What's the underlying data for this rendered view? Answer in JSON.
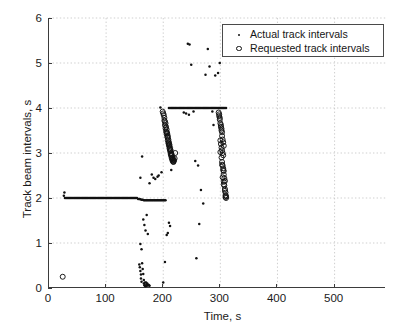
{
  "chart_data": {
    "type": "scatter",
    "title": "",
    "xlabel": "Time, s",
    "ylabel": "Track beam intervals, s",
    "xlim": [
      0,
      590
    ],
    "ylim": [
      0,
      6
    ],
    "xticks": [
      0,
      100,
      200,
      300,
      400,
      500
    ],
    "yticks": [
      0,
      1,
      2,
      3,
      4,
      5,
      6
    ],
    "grid": true,
    "legend_position": "top-right",
    "series": [
      {
        "name": "Actual track intervals",
        "marker": "dot",
        "color": "#111111",
        "points": [
          [
            26,
            2.05
          ],
          [
            27,
            2.12
          ],
          [
            28,
            2.0
          ],
          [
            30,
            2.0
          ],
          [
            32,
            2.0
          ],
          [
            34,
            2.0
          ],
          [
            36,
            2.0
          ],
          [
            38,
            2.0
          ],
          [
            40,
            2.0
          ],
          [
            42,
            2.0
          ],
          [
            44,
            2.0
          ],
          [
            46,
            2.0
          ],
          [
            48,
            2.0
          ],
          [
            50,
            2.0
          ],
          [
            52,
            2.0
          ],
          [
            54,
            2.0
          ],
          [
            56,
            2.0
          ],
          [
            58,
            2.0
          ],
          [
            60,
            2.0
          ],
          [
            62,
            2.0
          ],
          [
            64,
            2.0
          ],
          [
            66,
            2.0
          ],
          [
            68,
            2.0
          ],
          [
            70,
            2.0
          ],
          [
            72,
            2.0
          ],
          [
            74,
            2.0
          ],
          [
            76,
            2.0
          ],
          [
            78,
            2.0
          ],
          [
            80,
            2.0
          ],
          [
            82,
            2.0
          ],
          [
            84,
            2.0
          ],
          [
            86,
            2.0
          ],
          [
            88,
            2.0
          ],
          [
            90,
            2.0
          ],
          [
            92,
            2.0
          ],
          [
            94,
            2.0
          ],
          [
            96,
            2.0
          ],
          [
            98,
            2.0
          ],
          [
            100,
            2.0
          ],
          [
            102,
            2.0
          ],
          [
            104,
            2.0
          ],
          [
            106,
            2.0
          ],
          [
            108,
            2.0
          ],
          [
            110,
            2.0
          ],
          [
            112,
            2.0
          ],
          [
            114,
            2.0
          ],
          [
            116,
            2.0
          ],
          [
            118,
            2.0
          ],
          [
            120,
            2.0
          ],
          [
            122,
            2.0
          ],
          [
            124,
            2.0
          ],
          [
            126,
            2.0
          ],
          [
            128,
            2.0
          ],
          [
            130,
            2.0
          ],
          [
            132,
            2.0
          ],
          [
            134,
            2.0
          ],
          [
            136,
            2.0
          ],
          [
            138,
            2.0
          ],
          [
            140,
            2.0
          ],
          [
            142,
            2.0
          ],
          [
            144,
            2.0
          ],
          [
            146,
            2.0
          ],
          [
            148,
            2.0
          ],
          [
            150,
            2.0
          ],
          [
            152,
            2.0
          ],
          [
            154,
            2.0
          ],
          [
            156,
            1.98
          ],
          [
            158,
            1.98
          ],
          [
            160,
            1.97
          ],
          [
            162,
            1.96
          ],
          [
            164,
            1.96
          ],
          [
            166,
            1.95
          ],
          [
            168,
            1.95
          ],
          [
            170,
            1.95
          ],
          [
            172,
            1.95
          ],
          [
            174,
            1.95
          ],
          [
            176,
            1.95
          ],
          [
            178,
            1.95
          ],
          [
            180,
            1.95
          ],
          [
            182,
            1.95
          ],
          [
            184,
            1.95
          ],
          [
            186,
            1.95
          ],
          [
            188,
            1.95
          ],
          [
            190,
            1.95
          ],
          [
            192,
            1.95
          ],
          [
            194,
            1.95
          ],
          [
            196,
            1.95
          ],
          [
            198,
            1.95
          ],
          [
            200,
            1.95
          ],
          [
            202,
            1.95
          ],
          [
            204,
            1.95
          ],
          [
            158,
            0.52
          ],
          [
            159,
            0.46
          ],
          [
            160,
            0.38
          ],
          [
            161,
            0.3
          ],
          [
            161,
            0.21
          ],
          [
            162,
            0.14
          ],
          [
            163,
            0.55
          ],
          [
            164,
            0.42
          ],
          [
            165,
            0.31
          ],
          [
            166,
            0.18
          ],
          [
            166,
            0.1
          ],
          [
            167,
            0.06
          ],
          [
            168,
            0.05
          ],
          [
            169,
            0.04
          ],
          [
            170,
            0.06
          ],
          [
            171,
            0.05
          ],
          [
            172,
            0.06
          ],
          [
            173,
            0.06
          ],
          [
            174,
            0.07
          ],
          [
            175,
            0.06
          ],
          [
            176,
            0.05
          ],
          [
            168,
            0.12
          ],
          [
            170,
            0.12
          ],
          [
            172,
            0.1
          ],
          [
            160,
            0.98
          ],
          [
            162,
            0.86
          ],
          [
            165,
            1.52
          ],
          [
            167,
            1.4
          ],
          [
            169,
            1.28
          ],
          [
            171,
            1.62
          ],
          [
            173,
            1.2
          ],
          [
            160,
            2.45
          ],
          [
            163,
            2.92
          ],
          [
            176,
            2.33
          ],
          [
            180,
            2.52
          ],
          [
            183,
            2.45
          ],
          [
            186,
            2.42
          ],
          [
            190,
            2.47
          ],
          [
            192,
            2.5
          ],
          [
            195,
            4.01
          ],
          [
            197,
            2.57
          ],
          [
            200,
            0.12
          ],
          [
            203,
            0.58
          ],
          [
            206,
            1.18
          ],
          [
            208,
            1.22
          ],
          [
            210,
            1.45
          ],
          [
            212,
            1.38
          ],
          [
            214,
            2.62
          ],
          [
            216,
            2.82
          ],
          [
            218,
            2.9
          ],
          [
            210,
            4.0
          ],
          [
            212,
            4.0
          ],
          [
            214,
            4.0
          ],
          [
            216,
            4.0
          ],
          [
            218,
            4.0
          ],
          [
            220,
            4.0
          ],
          [
            222,
            4.0
          ],
          [
            224,
            4.0
          ],
          [
            226,
            4.0
          ],
          [
            228,
            4.0
          ],
          [
            230,
            4.0
          ],
          [
            232,
            4.0
          ],
          [
            234,
            4.0
          ],
          [
            236,
            4.0
          ],
          [
            238,
            4.0
          ],
          [
            240,
            4.0
          ],
          [
            242,
            4.0
          ],
          [
            244,
            4.0
          ],
          [
            246,
            4.0
          ],
          [
            248,
            4.0
          ],
          [
            250,
            4.0
          ],
          [
            252,
            4.0
          ],
          [
            254,
            4.0
          ],
          [
            256,
            4.0
          ],
          [
            258,
            4.0
          ],
          [
            260,
            4.0
          ],
          [
            262,
            4.0
          ],
          [
            264,
            4.0
          ],
          [
            266,
            4.0
          ],
          [
            268,
            4.0
          ],
          [
            270,
            4.0
          ],
          [
            272,
            4.0
          ],
          [
            274,
            4.0
          ],
          [
            276,
            4.0
          ],
          [
            278,
            4.0
          ],
          [
            280,
            4.0
          ],
          [
            282,
            4.0
          ],
          [
            284,
            4.0
          ],
          [
            286,
            4.0
          ],
          [
            288,
            4.0
          ],
          [
            290,
            4.0
          ],
          [
            292,
            4.0
          ],
          [
            294,
            4.0
          ],
          [
            296,
            4.0
          ],
          [
            298,
            4.0
          ],
          [
            300,
            4.0
          ],
          [
            302,
            4.0
          ],
          [
            304,
            4.0
          ],
          [
            306,
            4.0
          ],
          [
            308,
            4.0
          ],
          [
            310,
            4.0
          ],
          [
            243,
            5.43
          ],
          [
            246,
            5.41
          ],
          [
            249,
            4.96
          ],
          [
            253,
            3.92
          ],
          [
            256,
            2.82
          ],
          [
            258,
            0.66
          ],
          [
            261,
            2.72
          ],
          [
            263,
            1.42
          ],
          [
            266,
            2.18
          ],
          [
            270,
            1.88
          ],
          [
            274,
            4.74
          ],
          [
            278,
            5.31
          ],
          [
            281,
            4.92
          ],
          [
            286,
            3.92
          ],
          [
            291,
            4.72
          ],
          [
            296,
            4.78
          ],
          [
            299,
            5.0
          ],
          [
            288,
            3.62
          ],
          [
            245,
            3.85
          ],
          [
            240,
            3.88
          ],
          [
            236,
            3.9
          ]
        ]
      },
      {
        "name": "Requested track intervals",
        "marker": "circle",
        "color": "#111111",
        "points": [
          [
            24,
            0.25
          ],
          [
            199,
            3.92
          ],
          [
            201,
            3.84
          ],
          [
            202,
            3.72
          ],
          [
            203,
            3.62
          ],
          [
            204,
            3.55
          ],
          [
            205,
            3.48
          ],
          [
            206,
            3.42
          ],
          [
            207,
            3.36
          ],
          [
            208,
            3.28
          ],
          [
            209,
            3.22
          ],
          [
            210,
            3.16
          ],
          [
            211,
            3.1
          ],
          [
            212,
            3.04
          ],
          [
            213,
            2.98
          ],
          [
            214,
            2.93
          ],
          [
            215,
            2.88
          ],
          [
            216,
            2.84
          ],
          [
            217,
            2.81
          ],
          [
            218,
            2.8
          ],
          [
            203,
            3.7
          ],
          [
            205,
            3.58
          ],
          [
            207,
            3.44
          ],
          [
            209,
            3.3
          ],
          [
            211,
            3.18
          ],
          [
            213,
            3.06
          ],
          [
            215,
            2.96
          ],
          [
            217,
            2.86
          ],
          [
            200,
            3.88
          ],
          [
            202,
            3.78
          ],
          [
            204,
            3.66
          ],
          [
            206,
            3.52
          ],
          [
            208,
            3.38
          ],
          [
            210,
            3.24
          ],
          [
            212,
            3.12
          ],
          [
            214,
            3.0
          ],
          [
            216,
            2.9
          ],
          [
            218,
            2.82
          ],
          [
            206,
            3.46
          ],
          [
            210,
            3.2
          ],
          [
            214,
            2.96
          ],
          [
            208,
            3.34
          ],
          [
            212,
            3.08
          ],
          [
            216,
            2.88
          ],
          [
            219,
            2.84
          ],
          [
            220,
            2.88
          ],
          [
            221,
            3.0
          ],
          [
            297,
            3.9
          ],
          [
            298,
            3.82
          ],
          [
            299,
            3.74
          ],
          [
            300,
            3.66
          ],
          [
            301,
            3.58
          ],
          [
            302,
            3.5
          ],
          [
            300,
            3.28
          ],
          [
            301,
            3.2
          ],
          [
            302,
            3.12
          ],
          [
            303,
            3.06
          ],
          [
            304,
            3.0
          ],
          [
            305,
            2.95
          ],
          [
            300,
            3.02
          ],
          [
            302,
            2.9
          ],
          [
            303,
            2.8
          ],
          [
            304,
            2.72
          ],
          [
            305,
            2.66
          ],
          [
            306,
            2.6
          ],
          [
            303,
            2.74
          ],
          [
            305,
            2.62
          ],
          [
            306,
            2.52
          ],
          [
            307,
            2.44
          ],
          [
            308,
            2.38
          ],
          [
            304,
            2.46
          ],
          [
            306,
            2.36
          ],
          [
            307,
            2.28
          ],
          [
            308,
            2.2
          ],
          [
            309,
            2.12
          ],
          [
            306,
            2.3
          ],
          [
            308,
            2.16
          ],
          [
            309,
            2.06
          ],
          [
            310,
            2.0
          ],
          [
            309,
            2.02
          ],
          [
            310,
            2.04
          ],
          [
            298,
            3.86
          ],
          [
            299,
            3.78
          ],
          [
            301,
            3.62
          ],
          [
            302,
            3.54
          ],
          [
            303,
            3.46
          ],
          [
            303,
            3.38
          ],
          [
            304,
            3.3
          ],
          [
            305,
            3.24
          ],
          [
            306,
            3.16
          ]
        ]
      }
    ]
  },
  "legend": {
    "items": [
      {
        "symbol": "dot",
        "label": "Actual track intervals"
      },
      {
        "symbol": "circle",
        "label": "Requested track intervals"
      }
    ]
  },
  "axes": {
    "x_title": "Time, s",
    "y_title": "Track beam intervals, s",
    "x_tick_labels": [
      "0",
      "100",
      "200",
      "300",
      "400",
      "500"
    ],
    "y_tick_labels": [
      "0",
      "1",
      "2",
      "3",
      "4",
      "5",
      "6"
    ]
  },
  "colors": {
    "axis": "#3b3b3b",
    "grid": "#c9c9c9",
    "marker": "#111111",
    "background": "#ffffff"
  }
}
